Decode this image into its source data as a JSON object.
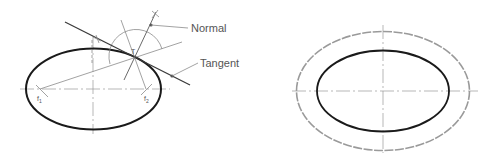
{
  "figure_left": {
    "title": "Tangent and normal to an ellipse",
    "labels": {
      "normal": "Normal",
      "tangent": "Tangent",
      "point": "T",
      "focus1": "f",
      "focus1_sub": "1",
      "focus2": "f",
      "focus2_sub": "2"
    },
    "ellipse": {
      "cx": 93.5,
      "cy": 89,
      "rx": 67.5,
      "ry": 40.5
    },
    "point_T": [
      135,
      58
    ],
    "focus1": [
      40,
      89
    ],
    "focus2": [
      146,
      89
    ]
  },
  "figure_right": {
    "title": "Concentric ellipse offset construction",
    "inner_ellipse": {
      "cx": 383,
      "cy": 91,
      "rx": 66,
      "ry": 40.5
    },
    "outer_ellipse": {
      "cx": 383,
      "cy": 91,
      "rx": 86.5,
      "ry": 59.5
    }
  },
  "colors": {
    "ink": "#1a1a1a",
    "construction": "#8a8a8a",
    "text": "#555555",
    "background": "#ffffff"
  }
}
